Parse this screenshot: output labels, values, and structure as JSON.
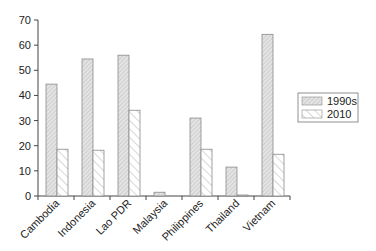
{
  "chart_data": {
    "type": "bar",
    "title": "",
    "xlabel": "",
    "ylabel": "",
    "ylim": [
      0,
      70
    ],
    "yticks": [
      0,
      10,
      20,
      30,
      40,
      50,
      60,
      70
    ],
    "grid": false,
    "legend_position": "right",
    "categories": [
      "Cambodia",
      "Indonesia",
      "Lao PDR",
      "Malaysia",
      "Philippines",
      "Thailand",
      "Vietnam"
    ],
    "series": [
      {
        "name": "1990s",
        "values": [
          44.5,
          54.5,
          56.0,
          1.5,
          31.0,
          11.5,
          64.3
        ],
        "fill": "#e4e4e4",
        "pattern": "dense-diagonal"
      },
      {
        "name": "2010",
        "values": [
          18.6,
          18.2,
          34.1,
          0.0,
          18.6,
          0.4,
          16.6
        ],
        "fill": "#ffffff",
        "pattern": "sparse-diagonal"
      }
    ]
  },
  "colors": {
    "axis": "#444444",
    "bar_outline": "#8a8a8a",
    "hatch_1990s": "#b8b8b8",
    "hatch_2010": "#9a9a9a"
  }
}
